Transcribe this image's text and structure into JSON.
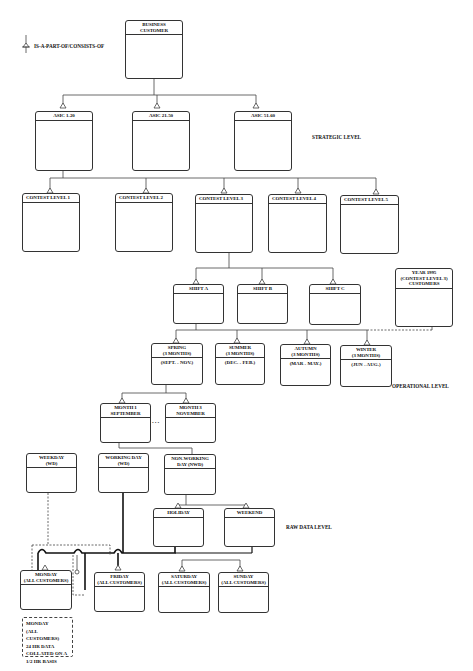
{
  "legend": {
    "icon": "aggregation-arrow-icon",
    "label": "IS-A-PART-OF/CONSISTS-OF"
  },
  "level_labels": {
    "strategic": "STRATEGIC LEVEL",
    "operational": "OPERATIONAL LEVEL",
    "raw": "RAW DATA LEVEL"
  },
  "nodes": {
    "root": "BUSINESS\nCUSTOMER",
    "asic": [
      "ASIC 1-20",
      "ASIC 21-50",
      "ASIC 51-60"
    ],
    "contest": [
      "CONTEST LEVEL 1",
      "CONTEST LEVEL 2",
      "CONTEST LEVEL 3",
      "CONTEST LEVEL 4",
      "CONTEST LEVEL 5"
    ],
    "shifts": [
      "SHIFT A",
      "SHIFT B",
      "SHIFT C"
    ],
    "year": "YEAR 1995\n(CONTEST LEVEL 3)\nCUSTOMERS",
    "seasons": [
      {
        "title": "SPRING\n(3 MONTHS)",
        "range": "(SEPT. - NOV.)"
      },
      {
        "title": "SUMMER\n(3 MONTHS)",
        "range": "(DEC. - FEB.)"
      },
      {
        "title": "AUTUMN\n(3 MONTHS)",
        "range": "(MAR - MAY.)"
      },
      {
        "title": "WINTER\n(3 MONTHS)",
        "range": "(JUN - AUG.)"
      }
    ],
    "months": [
      "MONTH 1\nSEPTEMBER",
      "MONTH 3\nNOVEMBER"
    ],
    "ellipsis": "...",
    "weekday": "WEEKDAY\n(WD)",
    "working_day": "WORKING DAY\n(WD)",
    "non_working_day": "NON-WORKING\nDAY (NWD)",
    "holiday": "HOLIDAY",
    "weekend": "WEEKEND",
    "days": [
      "MONDAY\n(ALL CUSTOMERS)",
      "FRIDAY\n(ALL CUSTOMERS)",
      "SATURDAY\n(ALL CUSTOMERS)",
      "SUNDAY\n(ALL CUSTOMERS)"
    ],
    "monday_note": "MONDAY\n(ALL CUSTOMERS)\n24 HR DATA\nCOLLATED ON A\n1/2  HR BASIS"
  }
}
